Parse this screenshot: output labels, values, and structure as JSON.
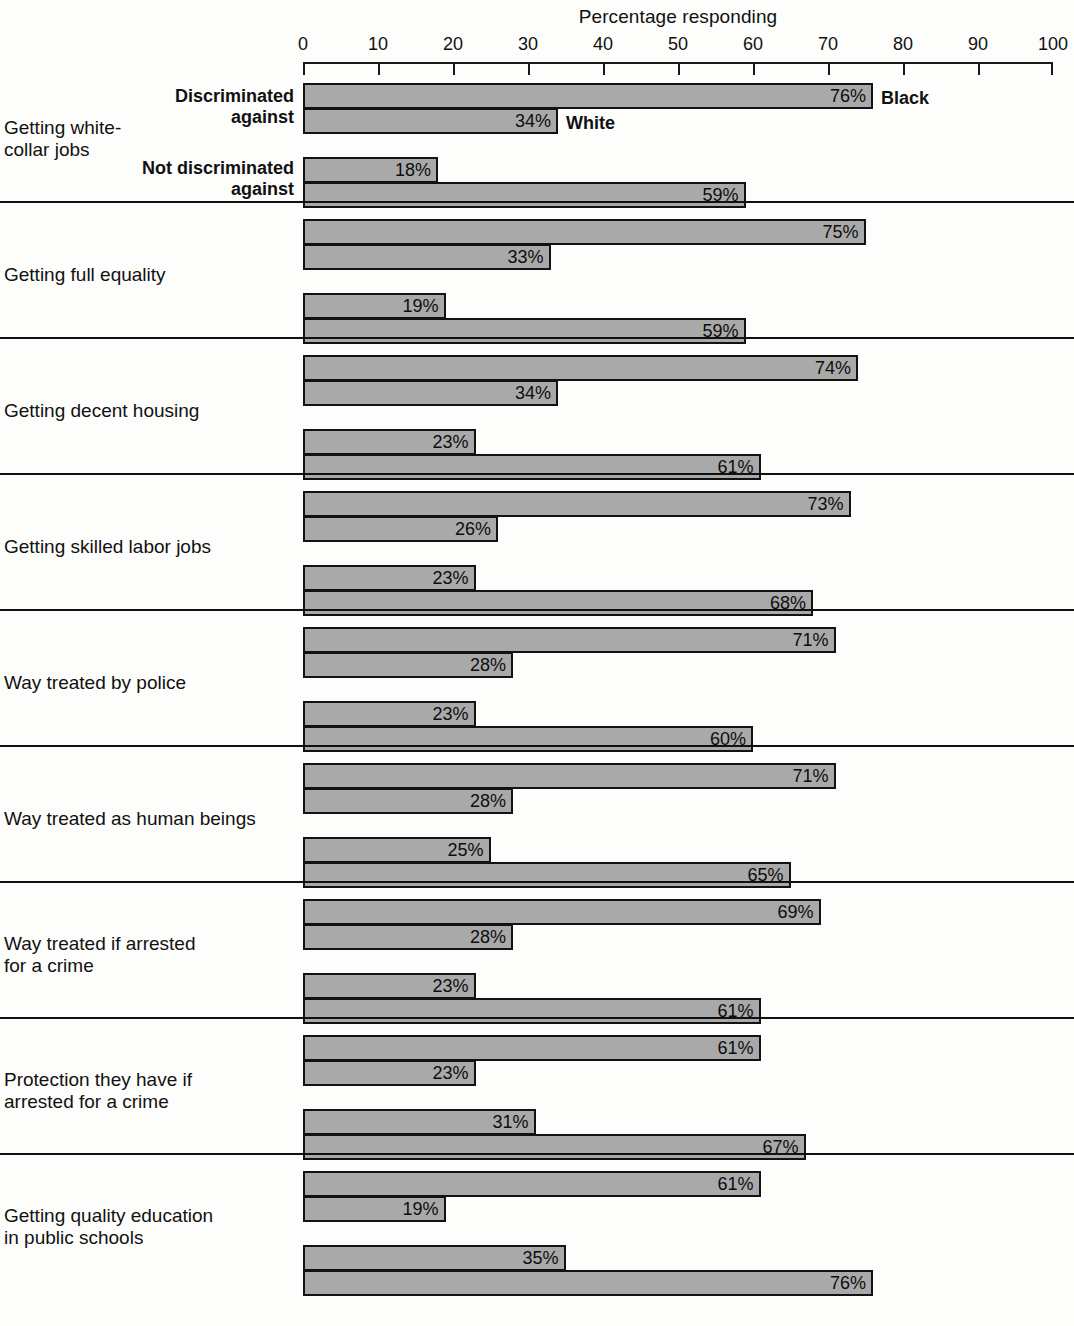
{
  "axis": {
    "title": "Percentage responding",
    "ticks": [
      0,
      10,
      20,
      30,
      40,
      50,
      60,
      70,
      80,
      90,
      100
    ],
    "tick_labels": [
      "0",
      "10",
      "20",
      "30",
      "40",
      "50",
      "60",
      "70",
      "80",
      "90",
      "100"
    ],
    "min": 0,
    "max": 100
  },
  "legend": {
    "black_label": "Black",
    "white_label": "White"
  },
  "row_labels": {
    "discriminated": "Discriminated\nagainst",
    "not_discriminated": "Not discriminated\nagainst"
  },
  "chart_data": {
    "type": "bar",
    "orientation": "horizontal",
    "title": "",
    "xlabel": "Percentage responding",
    "ylabel": "",
    "xlim": [
      0,
      100
    ],
    "grid": false,
    "legend_position": "inline-first-group",
    "categories": [
      "Getting white-collar jobs",
      "Getting full equality",
      "Getting decent housing",
      "Getting skilled labor jobs",
      "Way treated by police",
      "Way treated as human beings",
      "Way treated if arrested for a crime",
      "Protection they have if arrested for a crime",
      "Getting quality education in public schools"
    ],
    "subgroups": [
      "Discriminated against",
      "Not discriminated against"
    ],
    "series": [
      {
        "name": "Black",
        "subgroup": "Discriminated against",
        "values": [
          76,
          75,
          74,
          73,
          71,
          71,
          69,
          61,
          61
        ]
      },
      {
        "name": "White",
        "subgroup": "Discriminated against",
        "values": [
          34,
          33,
          34,
          26,
          28,
          28,
          28,
          23,
          19
        ]
      },
      {
        "name": "Black",
        "subgroup": "Not discriminated against",
        "values": [
          18,
          19,
          23,
          23,
          23,
          25,
          23,
          31,
          35
        ]
      },
      {
        "name": "White",
        "subgroup": "Not discriminated against",
        "values": [
          59,
          59,
          61,
          68,
          60,
          65,
          61,
          67,
          76
        ]
      }
    ],
    "value_suffix": "%"
  },
  "groups": [
    {
      "label_line1": "Getting white-",
      "label_line2": "collar jobs",
      "bars": [
        {
          "value": 76,
          "label": "76%",
          "series": "Black"
        },
        {
          "value": 34,
          "label": "34%",
          "series": "White"
        },
        {
          "value": 18,
          "label": "18%",
          "series": "Black"
        },
        {
          "value": 59,
          "label": "59%",
          "series": "White"
        }
      ]
    },
    {
      "label_line1": "Getting full equality",
      "label_line2": "",
      "bars": [
        {
          "value": 75,
          "label": "75%",
          "series": "Black"
        },
        {
          "value": 33,
          "label": "33%",
          "series": "White"
        },
        {
          "value": 19,
          "label": "19%",
          "series": "Black"
        },
        {
          "value": 59,
          "label": "59%",
          "series": "White"
        }
      ]
    },
    {
      "label_line1": "Getting decent housing",
      "label_line2": "",
      "bars": [
        {
          "value": 74,
          "label": "74%",
          "series": "Black"
        },
        {
          "value": 34,
          "label": "34%",
          "series": "White"
        },
        {
          "value": 23,
          "label": "23%",
          "series": "Black"
        },
        {
          "value": 61,
          "label": "61%",
          "series": "White"
        }
      ]
    },
    {
      "label_line1": "Getting skilled labor jobs",
      "label_line2": "",
      "bars": [
        {
          "value": 73,
          "label": "73%",
          "series": "Black"
        },
        {
          "value": 26,
          "label": "26%",
          "series": "White"
        },
        {
          "value": 23,
          "label": "23%",
          "series": "Black"
        },
        {
          "value": 68,
          "label": "68%",
          "series": "White"
        }
      ]
    },
    {
      "label_line1": "Way treated by police",
      "label_line2": "",
      "bars": [
        {
          "value": 71,
          "label": "71%",
          "series": "Black"
        },
        {
          "value": 28,
          "label": "28%",
          "series": "White"
        },
        {
          "value": 23,
          "label": "23%",
          "series": "Black"
        },
        {
          "value": 60,
          "label": "60%",
          "series": "White"
        }
      ]
    },
    {
      "label_line1": "Way treated as human beings",
      "label_line2": "",
      "bars": [
        {
          "value": 71,
          "label": "71%",
          "series": "Black"
        },
        {
          "value": 28,
          "label": "28%",
          "series": "White"
        },
        {
          "value": 25,
          "label": "25%",
          "series": "Black"
        },
        {
          "value": 65,
          "label": "65%",
          "series": "White"
        }
      ]
    },
    {
      "label_line1": "Way treated if arrested",
      "label_line2": "for a crime",
      "bars": [
        {
          "value": 69,
          "label": "69%",
          "series": "Black"
        },
        {
          "value": 28,
          "label": "28%",
          "series": "White"
        },
        {
          "value": 23,
          "label": "23%",
          "series": "Black"
        },
        {
          "value": 61,
          "label": "61%",
          "series": "White"
        }
      ]
    },
    {
      "label_line1": "Protection they have if",
      "label_line2": "arrested for a crime",
      "bars": [
        {
          "value": 61,
          "label": "61%",
          "series": "Black"
        },
        {
          "value": 23,
          "label": "23%",
          "series": "White"
        },
        {
          "value": 31,
          "label": "31%",
          "series": "Black"
        },
        {
          "value": 67,
          "label": "67%",
          "series": "White"
        }
      ]
    },
    {
      "label_line1": "Getting quality education",
      "label_line2": "in public schools",
      "bars": [
        {
          "value": 61,
          "label": "61%",
          "series": "Black"
        },
        {
          "value": 19,
          "label": "19%",
          "series": "Black"
        },
        {
          "value": 35,
          "label": "35%",
          "series": "Black"
        },
        {
          "value": 76,
          "label": "76%",
          "series": "White"
        }
      ]
    }
  ],
  "colors": {
    "bar_fill": "#a9a9a9",
    "bar_border": "#121212",
    "text": "#111111",
    "background": "#fdfdfb"
  }
}
